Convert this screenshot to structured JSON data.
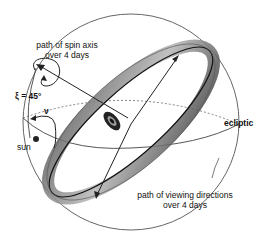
{
  "diagram": {
    "labels": {
      "spin_axis_path_line1": "path of spin axis",
      "spin_axis_path_line2": "over 4 days",
      "xi_angle": "ξ = 45°",
      "nu_angle": "ν",
      "sun": "sun",
      "ecliptic": "ecliptic",
      "viewing_path_line1": "path of viewing directions",
      "viewing_path_line2": "over 4 days"
    },
    "colors": {
      "line": "#333333",
      "band": "#9a9a9a",
      "band_dark": "#1a1a1a",
      "sphere": "#666666"
    }
  }
}
